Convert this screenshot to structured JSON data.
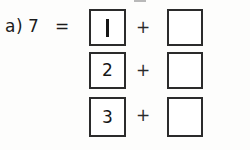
{
  "page": {
    "background_color": "#fdfdfc",
    "ink_color": "#1b1b1b",
    "box_border_color": "#2b2b2b"
  },
  "problem": {
    "item_letter": "a)",
    "target_number": "7",
    "equals": "=",
    "label_full": "a) 7  ="
  },
  "rows": [
    {
      "left_value": "1",
      "operator": "+",
      "right_value": "",
      "right_is_blank": true
    },
    {
      "left_value": "2",
      "operator": "+",
      "right_value": "",
      "right_is_blank": true
    },
    {
      "left_value": "3",
      "operator": "+",
      "right_value": "",
      "right_is_blank": true
    }
  ]
}
